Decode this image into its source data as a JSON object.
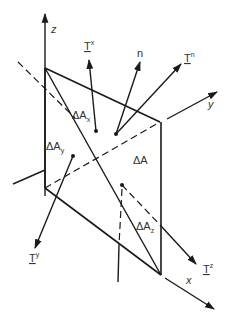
{
  "diagram": {
    "axes": {
      "z": "z",
      "y": "y",
      "x": "x"
    },
    "normal": "n",
    "tractions": {
      "Tn": {
        "base": "T",
        "sup": "n"
      },
      "Tx": {
        "base": "T",
        "sup": "x"
      },
      "Ty": {
        "base": "T",
        "sup": "y"
      },
      "Tz": {
        "base": "T",
        "sup": "z"
      }
    },
    "areas": {
      "dA": {
        "delta": "Δ",
        "base": "A",
        "sub": ""
      },
      "dAx": {
        "delta": "Δ",
        "base": "A",
        "sub": "x"
      },
      "dAy": {
        "delta": "Δ",
        "base": "A",
        "sub": "y"
      },
      "dAz": {
        "delta": "Δ",
        "base": "A",
        "sub": "z"
      }
    },
    "colors": {
      "line": "#1a1a1a",
      "text": "#333333",
      "background": "#ffffff"
    }
  }
}
